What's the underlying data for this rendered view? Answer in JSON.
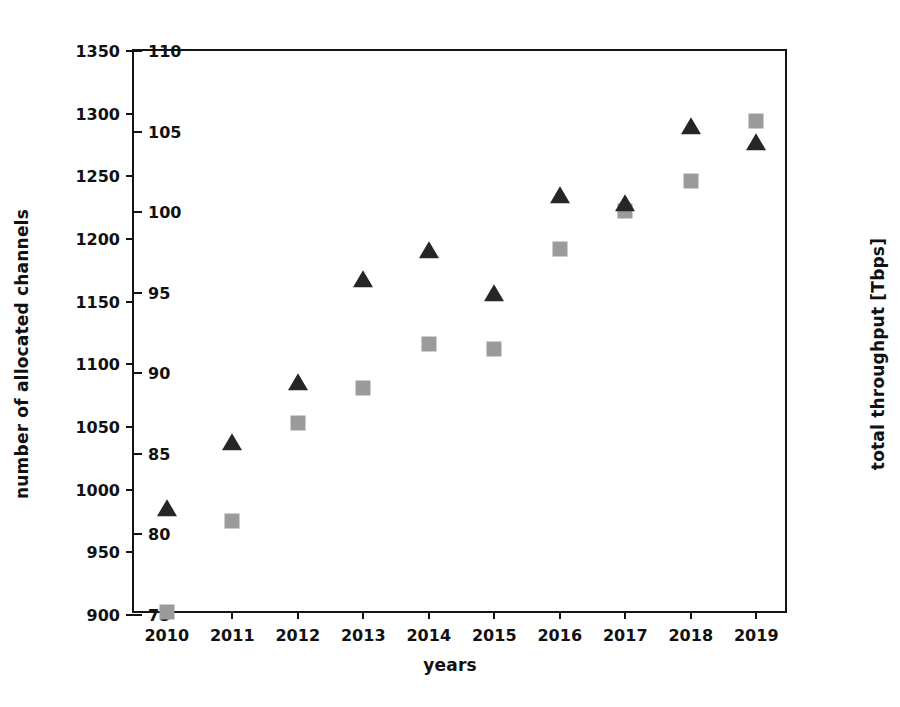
{
  "chart_data": {
    "type": "scatter",
    "title": "",
    "xlabel": "years",
    "ylabel": "number of allocated channels",
    "ylabel_right": "total throughput [Tbps]",
    "categories": [
      "2010",
      "2011",
      "2012",
      "2013",
      "2014",
      "2015",
      "2016",
      "2017",
      "2018",
      "2019"
    ],
    "x": [
      2010,
      2011,
      2012,
      2013,
      2014,
      2015,
      2016,
      2017,
      2018,
      2019
    ],
    "ylim": [
      900,
      1350
    ],
    "ylim_right": [
      75,
      110
    ],
    "yticks": [
      900,
      950,
      1000,
      1050,
      1100,
      1150,
      1200,
      1250,
      1300,
      1350
    ],
    "yticks_right": [
      75,
      80,
      85,
      90,
      95,
      100,
      105,
      110
    ],
    "grid": false,
    "legend": "none",
    "series": [
      {
        "name": "number of allocated channels",
        "axis": "left",
        "marker": "square",
        "color": "#9b9b9b",
        "values": [
          902,
          975,
          1053,
          1081,
          1116,
          1112,
          1192,
          1222,
          1246,
          1294
        ]
      },
      {
        "name": "total throughput [Tbps]",
        "axis": "right",
        "marker": "triangle",
        "color": "#262626",
        "values": [
          81.6,
          85.7,
          89.4,
          95.8,
          97.6,
          94.9,
          101.0,
          100.5,
          105.3,
          104.3
        ]
      }
    ]
  }
}
